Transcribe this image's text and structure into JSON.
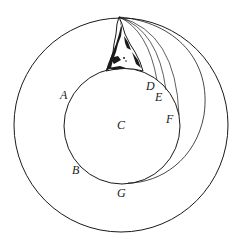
{
  "diagram": {
    "type": "newton-cannonball",
    "colors": {
      "stroke": "#1a1a1a",
      "background": "#ffffff",
      "mountain_fill": "#1a1a1a"
    },
    "outer_circle": {
      "cx": 121,
      "cy": 125,
      "r": 107
    },
    "earth_circle": {
      "cx": 122,
      "cy": 126,
      "r": 58
    },
    "mountain_peak": {
      "x": 119,
      "y": 17
    },
    "labels": {
      "A": "A",
      "B": "B",
      "C": "C",
      "D": "D",
      "E": "E",
      "F": "F",
      "G": "G"
    },
    "trajectories": [
      "D",
      "E",
      "F",
      "G"
    ]
  }
}
